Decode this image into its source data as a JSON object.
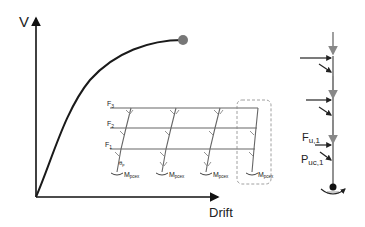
{
  "pushover_chart": {
    "y_axis_label": "V",
    "x_axis_label": "Drift",
    "curve_end_marker": "collapse-point",
    "colors": {
      "curve": "#1a1a1a",
      "marker": "#777777",
      "axis": "#111111"
    }
  },
  "frame": {
    "floor_forces": [
      "F",
      "F",
      "F"
    ],
    "floor_force_subs": [
      "3",
      "2",
      "1"
    ],
    "rotation_label": "θ",
    "rotation_sub": "p",
    "base_moment_label": "M",
    "base_moment_subs": [
      "pcex",
      "pcex",
      "pcex",
      "pcex"
    ],
    "highlight_box": "dashed-column-highlight",
    "colors": {
      "frame": "#666666",
      "box": "#888888"
    }
  },
  "column_detail": {
    "horizontal_force_label": "F",
    "horizontal_force_sub": "u,1",
    "axial_force_label": "P",
    "axial_force_sub": "uc,1",
    "colors": {
      "column": "#777777",
      "arrows": "#222222",
      "gravity_arrows": "#888888"
    }
  }
}
